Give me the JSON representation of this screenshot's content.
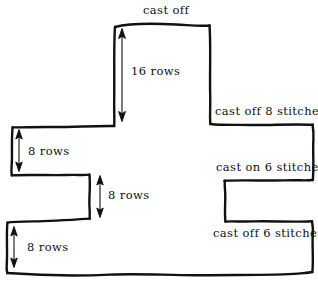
{
  "diagram": {
    "type": "outline-schematic",
    "stroke_color": "#111111",
    "background_color": "#ffffff",
    "width": 318,
    "height": 284,
    "outline_description": "hand-drawn wavy cross/T shaped garment piece with a raised neck section at top centre, a left arm with a notch below it, and a right arm with a notch below it",
    "edge_labels": [
      {
        "id": "cast-off-top",
        "text": "cast off",
        "x": 143,
        "y": 4,
        "edge": "neck-top"
      },
      {
        "id": "cast-off-8",
        "text": "cast off 8 stitches",
        "x": 215,
        "y": 105,
        "edge": "right-arm-top"
      },
      {
        "id": "cast-on-6",
        "text": "cast on 6 stitches",
        "x": 216,
        "y": 161,
        "edge": "right-arm-bottom"
      },
      {
        "id": "cast-off-6",
        "text": "cast off 6 stitches",
        "x": 213,
        "y": 227,
        "edge": "right-body-top"
      }
    ],
    "dimensions": [
      {
        "id": "neck-height",
        "text": "16 rows",
        "value": 16,
        "unit": "rows",
        "label_x": 131,
        "label_y": 65,
        "arrow_x": 122,
        "arrow_y1": 30,
        "arrow_y2": 120
      },
      {
        "id": "left-arm-height",
        "text": "8 rows",
        "value": 8,
        "unit": "rows",
        "label_x": 28,
        "label_y": 145,
        "arrow_x": 19,
        "arrow_y1": 131,
        "arrow_y2": 170
      },
      {
        "id": "middle-gap-height",
        "text": "8 rows",
        "value": 8,
        "unit": "rows",
        "label_x": 108,
        "label_y": 189,
        "arrow_x": 100,
        "arrow_y1": 176,
        "arrow_y2": 216
      },
      {
        "id": "bottom-arm-height",
        "text": "8 rows",
        "value": 8,
        "unit": "rows",
        "label_x": 27,
        "label_y": 241,
        "arrow_x": 14,
        "arrow_y1": 228,
        "arrow_y2": 266
      }
    ]
  }
}
